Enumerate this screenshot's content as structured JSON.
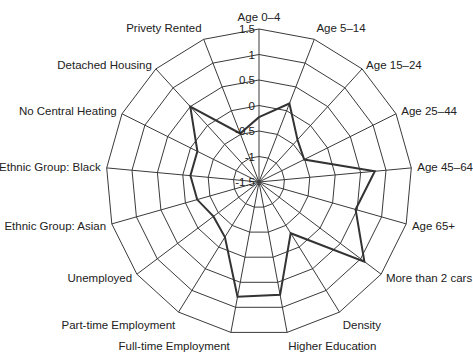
{
  "chart_data": {
    "type": "radar",
    "title": "",
    "categories": [
      "Age 0–4",
      "Age 5–14",
      "Age 15–24",
      "Age 25–44",
      "Age 45–64",
      "Age 65+",
      "More than 2 cars",
      "Density",
      "Higher Education",
      "Full-time Employment",
      "Part-time Employment",
      "Unemployed",
      "Ethnic Group: Asian",
      "Ethnic Group: Black",
      "No Central Heating",
      "Detached Housing",
      "Privety Rented"
    ],
    "series": [
      {
        "name": "Profile",
        "color": "#333333",
        "values": [
          -0.23,
          0.15,
          -0.38,
          -0.51,
          0.78,
          0.47,
          1.09,
          -0.32,
          0.75,
          0.79,
          -0.23,
          -0.38,
          -0.24,
          -0.15,
          -0.15,
          0.5,
          -0.48
        ]
      }
    ],
    "rlim": [
      -1.5,
      1.5
    ],
    "ticks": [
      "1.5",
      "1",
      "0.5",
      "0",
      "-0.5",
      "-1",
      "-1.5"
    ],
    "tick_values": [
      1.5,
      1,
      0.5,
      0,
      -0.5,
      -1,
      -1.5
    ],
    "grid": true,
    "legend": "none",
    "grid_color": "#3a3a3a",
    "line_color": "#333333"
  }
}
